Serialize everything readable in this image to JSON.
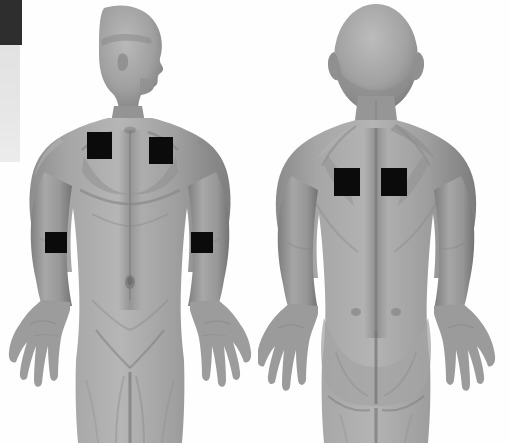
{
  "image": {
    "title": "Anterior and posterior human body views with electrode placement markers",
    "background_color": "#fefefe",
    "width": 510,
    "height": 443,
    "view_count": 2
  },
  "calibration_strip": {
    "name": "grayscale-calibration-strip",
    "dark_swatch_color": "#2e2e2e",
    "light_swatch_color": "#e6e6e6",
    "label": ""
  },
  "figures": [
    {
      "id": "anterior",
      "view_label": "",
      "orientation": "front",
      "head_pose": "profile-right",
      "skin_tone": "#9a9a9a"
    },
    {
      "id": "posterior",
      "view_label": "",
      "orientation": "back",
      "head_pose": "rear",
      "skin_tone": "#9a9a9a"
    }
  ],
  "markers": [
    {
      "id": "m1",
      "label": "",
      "figure": "anterior",
      "region": "right-upper-chest",
      "color": "#0b0b0b",
      "x": 87,
      "y": 132,
      "w": 25,
      "h": 27
    },
    {
      "id": "m2",
      "label": "",
      "figure": "anterior",
      "region": "left-upper-chest",
      "color": "#0b0b0b",
      "x": 149,
      "y": 137,
      "w": 24,
      "h": 27
    },
    {
      "id": "m3",
      "label": "",
      "figure": "anterior",
      "region": "right-forearm",
      "color": "#0b0b0b",
      "x": 45,
      "y": 232,
      "w": 22,
      "h": 21
    },
    {
      "id": "m4",
      "label": "",
      "figure": "anterior",
      "region": "left-forearm",
      "color": "#0b0b0b",
      "x": 191,
      "y": 232,
      "w": 22,
      "h": 21
    },
    {
      "id": "m5",
      "label": "",
      "figure": "posterior",
      "region": "left-mid-back",
      "color": "#0b0b0b",
      "x": 334,
      "y": 168,
      "w": 26,
      "h": 28
    },
    {
      "id": "m6",
      "label": "",
      "figure": "posterior",
      "region": "right-mid-back",
      "color": "#0b0b0b",
      "x": 381,
      "y": 168,
      "w": 26,
      "h": 28
    }
  ]
}
